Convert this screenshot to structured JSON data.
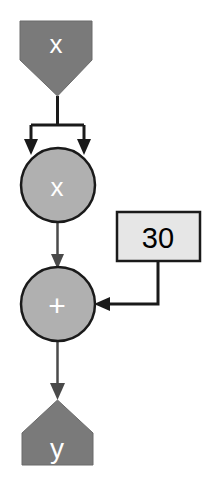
{
  "diagram": {
    "background_color": "#ffffff",
    "palette": {
      "terminal_fill": "#7a7a7a",
      "operator_fill": "#b0b0b0",
      "constant_fill": "#e6e6e6",
      "stroke": "#1a1a1a",
      "terminal_text": "#ffffff",
      "operator_text": "#ffffff",
      "constant_text": "#000000"
    },
    "nodes": [
      {
        "id": "input-x",
        "label": "x",
        "role": "input-terminal",
        "shape": "pentagon-down",
        "fill": "#7a7a7a",
        "text_color": "#ffffff"
      },
      {
        "id": "op-multiply",
        "label": "x",
        "role": "operator",
        "operation": "multiply",
        "shape": "circle",
        "fill": "#b0b0b0",
        "text_color": "#ffffff"
      },
      {
        "id": "const-30",
        "label": "30",
        "role": "constant",
        "shape": "rectangle",
        "fill": "#e6e6e6",
        "text_color": "#000000"
      },
      {
        "id": "op-add",
        "label": "+",
        "role": "operator",
        "operation": "add",
        "shape": "circle",
        "fill": "#b0b0b0",
        "text_color": "#ffffff"
      },
      {
        "id": "output-y",
        "label": "y",
        "role": "output-terminal",
        "shape": "pentagon-up",
        "fill": "#7a7a7a",
        "text_color": "#ffffff"
      }
    ],
    "edges": [
      {
        "id": "edge-x-to-multiply-left",
        "from": "input-x",
        "to": "op-multiply",
        "style": "forked-arrow"
      },
      {
        "id": "edge-x-to-multiply-right",
        "from": "input-x",
        "to": "op-multiply",
        "style": "forked-arrow"
      },
      {
        "id": "edge-multiply-to-add",
        "from": "op-multiply",
        "to": "op-add",
        "style": "straight-arrow"
      },
      {
        "id": "edge-const-to-add",
        "from": "const-30",
        "to": "op-add",
        "style": "elbow-arrow"
      },
      {
        "id": "edge-add-to-y",
        "from": "op-add",
        "to": "output-y",
        "style": "straight-arrow"
      }
    ]
  }
}
